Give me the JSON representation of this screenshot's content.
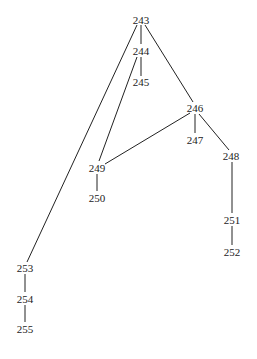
{
  "diagram": {
    "type": "tree",
    "nodes": [
      {
        "id": "243",
        "label": "243",
        "x": 141,
        "y": 20
      },
      {
        "id": "244",
        "label": "244",
        "x": 141,
        "y": 51
      },
      {
        "id": "245",
        "label": "245",
        "x": 141,
        "y": 82
      },
      {
        "id": "246",
        "label": "246",
        "x": 195,
        "y": 108
      },
      {
        "id": "247",
        "label": "247",
        "x": 195,
        "y": 140
      },
      {
        "id": "248",
        "label": "248",
        "x": 231,
        "y": 156
      },
      {
        "id": "249",
        "label": "249",
        "x": 97,
        "y": 168
      },
      {
        "id": "250",
        "label": "250",
        "x": 97,
        "y": 198
      },
      {
        "id": "251",
        "label": "251",
        "x": 232,
        "y": 220
      },
      {
        "id": "252",
        "label": "252",
        "x": 232,
        "y": 252
      },
      {
        "id": "253",
        "label": "253",
        "x": 25,
        "y": 268
      },
      {
        "id": "254",
        "label": "254",
        "x": 25,
        "y": 299
      },
      {
        "id": "255",
        "label": "255",
        "x": 25,
        "y": 329
      }
    ],
    "edges": [
      {
        "from": "243",
        "to": "244",
        "x1": 141,
        "y1": 25,
        "x2": 141,
        "y2": 44
      },
      {
        "from": "244",
        "to": "245",
        "x1": 141,
        "y1": 57,
        "x2": 141,
        "y2": 76
      },
      {
        "from": "243",
        "to": "246",
        "x1": 145,
        "y1": 25,
        "x2": 193,
        "y2": 102
      },
      {
        "from": "243",
        "to": "253",
        "x1": 137,
        "y1": 25,
        "x2": 27,
        "y2": 262
      },
      {
        "from": "244",
        "to": "249",
        "x1": 137,
        "y1": 57,
        "x2": 99,
        "y2": 161
      },
      {
        "from": "246",
        "to": "249",
        "x1": 190,
        "y1": 113,
        "x2": 105,
        "y2": 164
      },
      {
        "from": "246",
        "to": "247",
        "x1": 195,
        "y1": 114,
        "x2": 195,
        "y2": 133
      },
      {
        "from": "246",
        "to": "248",
        "x1": 199,
        "y1": 114,
        "x2": 229,
        "y2": 150
      },
      {
        "from": "249",
        "to": "250",
        "x1": 97,
        "y1": 174,
        "x2": 97,
        "y2": 191
      },
      {
        "from": "248",
        "to": "251",
        "x1": 232,
        "y1": 162,
        "x2": 232,
        "y2": 213
      },
      {
        "from": "251",
        "to": "252",
        "x1": 232,
        "y1": 226,
        "x2": 232,
        "y2": 245
      },
      {
        "from": "253",
        "to": "254",
        "x1": 25,
        "y1": 274,
        "x2": 25,
        "y2": 292
      },
      {
        "from": "254",
        "to": "255",
        "x1": 25,
        "y1": 305,
        "x2": 25,
        "y2": 322
      }
    ]
  }
}
